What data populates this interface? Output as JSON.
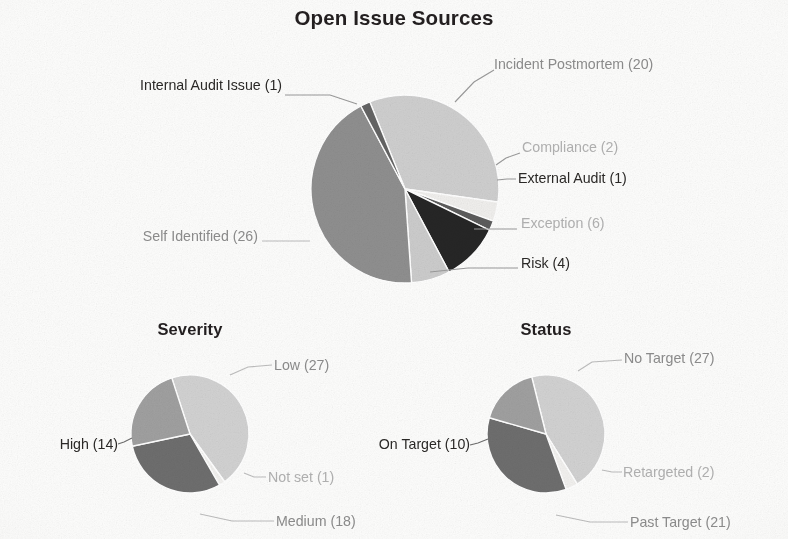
{
  "page": {
    "background": "#fdfdfc",
    "look": "scanned grayscale photocopy of a dashboard pie-chart report"
  },
  "headings": {
    "main_title": "Open Issue Sources",
    "severity_title": "Severity",
    "status_title": "Status"
  },
  "palette": {
    "light_gray": "#cfcfcf",
    "pale_gray": "#e6e6e6",
    "mid_gray": "#9b9b9b",
    "medium_gray": "#8a8a8a",
    "dark_gray": "#4b4b4b",
    "near_black": "#2a2a2a",
    "off_white": "#f4f4f2",
    "label_gray": "#6f6f6f",
    "label_dark": "#2b2927",
    "leader_line": "#9a9a9a"
  },
  "chart_data": [
    {
      "type": "pie",
      "id": "open-issue-sources",
      "title": "Open Issue Sources",
      "total": 60,
      "start_angle_deg": -22,
      "direction": "clockwise",
      "center": {
        "x": 405,
        "y": 189
      },
      "radius": 94,
      "legend": "labels with leader lines around the pie",
      "categories": [
        "Incident Postmortem",
        "Compliance",
        "External Audit",
        "Exception",
        "Risk",
        "Self Identified",
        "Internal Audit Issue"
      ],
      "values": [
        20,
        2,
        1,
        6,
        4,
        26,
        1
      ],
      "slices": [
        {
          "label": "Incident Postmortem (20)",
          "name": "Incident Postmortem",
          "value": 20,
          "percent": 33.3,
          "color": "#cfcfcf"
        },
        {
          "label": "Compliance (2)",
          "name": "Compliance",
          "value": 2,
          "percent": 3.3,
          "color": "#f0efed"
        },
        {
          "label": "External Audit (1)",
          "name": "External Audit",
          "value": 1,
          "percent": 1.7,
          "color": "#5c5c5c"
        },
        {
          "label": "Exception (6)",
          "name": "Exception",
          "value": 6,
          "percent": 10.0,
          "color": "#262626"
        },
        {
          "label": "Risk (4)",
          "name": "Risk",
          "value": 4,
          "percent": 6.7,
          "color": "#cccccc"
        },
        {
          "label": "Self Identified (26)",
          "name": "Self Identified",
          "value": 26,
          "percent": 43.3,
          "color": "#8f8f8f"
        },
        {
          "label": "Internal Audit Issue (1)",
          "name": "Internal Audit Issue",
          "value": 1,
          "percent": 1.7,
          "color": "#646464"
        }
      ]
    },
    {
      "type": "pie",
      "id": "severity",
      "title": "Severity",
      "total": 60,
      "start_angle_deg": -18,
      "direction": "clockwise",
      "center": {
        "x": 190,
        "y": 434
      },
      "radius": 59,
      "categories": [
        "Low",
        "Not set",
        "Medium",
        "High"
      ],
      "values": [
        27,
        1,
        18,
        14
      ],
      "slices": [
        {
          "label": "Low (27)",
          "name": "Low",
          "value": 27,
          "percent": 45.0,
          "color": "#d2d2d2"
        },
        {
          "label": "Not set (1)",
          "name": "Not set",
          "value": 1,
          "percent": 1.7,
          "color": "#f2f1ef"
        },
        {
          "label": "Medium (18)",
          "name": "Medium",
          "value": 18,
          "percent": 30.0,
          "color": "#6e6e6e"
        },
        {
          "label": "High (14)",
          "name": "High",
          "value": 14,
          "percent": 23.3,
          "color": "#a0a0a0"
        }
      ]
    },
    {
      "type": "pie",
      "id": "status",
      "title": "Status",
      "total": 60,
      "start_angle_deg": -14,
      "direction": "clockwise",
      "center": {
        "x": 546,
        "y": 434
      },
      "radius": 59,
      "categories": [
        "No Target",
        "Retargeted",
        "Past Target",
        "On Target"
      ],
      "values": [
        27,
        2,
        21,
        10
      ],
      "slices": [
        {
          "label": "No Target (27)",
          "name": "No Target",
          "value": 27,
          "percent": 45.0,
          "color": "#d2d2d2"
        },
        {
          "label": "Retargeted (2)",
          "name": "Retargeted",
          "value": 2,
          "percent": 3.3,
          "color": "#f2f1ef"
        },
        {
          "label": "Past Target (21)",
          "name": "Past Target",
          "value": 21,
          "percent": 35.0,
          "color": "#6e6e6e"
        },
        {
          "label": "On Target (10)",
          "name": "On Target",
          "value": 10,
          "percent": 16.7,
          "color": "#a0a0a0"
        }
      ]
    }
  ],
  "labels": {
    "main": {
      "incident_postmortem": "Incident Postmortem (20)",
      "compliance": "Compliance (2)",
      "external_audit": "External Audit (1)",
      "exception": "Exception (6)",
      "risk": "Risk (4)",
      "self_identified": "Self Identified (26)",
      "internal_audit_issue": "Internal Audit Issue (1)"
    },
    "severity": {
      "low": "Low (27)",
      "not_set": "Not set (1)",
      "medium": "Medium (18)",
      "high": "High (14)"
    },
    "status": {
      "no_target": "No Target (27)",
      "retargeted": "Retargeted (2)",
      "past_target": "Past Target (21)",
      "on_target": "On Target (10)"
    }
  }
}
